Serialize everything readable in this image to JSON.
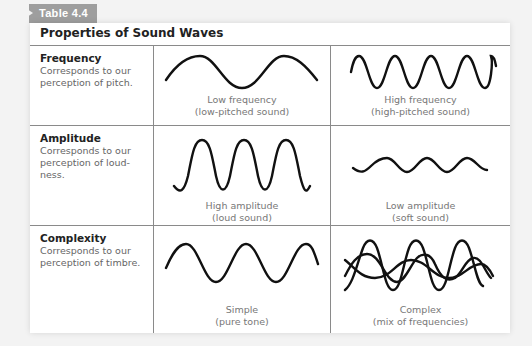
{
  "table_label": "Table 4.4",
  "title": "Properties of Sound Waves",
  "rows": [
    {
      "property": "Frequency",
      "description": "Corresponds to our perception of pitch.",
      "left": {
        "caption1": "Low frequency",
        "caption2": "(low-pitched sound)",
        "wave": "low-frequency-wave"
      },
      "right": {
        "caption1": "High frequency",
        "caption2": "(high-pitched sound)",
        "wave": "high-frequency-wave"
      }
    },
    {
      "property": "Amplitude",
      "description": "Corresponds to our perception of loud-ness.",
      "left": {
        "caption1": "High amplitude",
        "caption2": "(loud sound)",
        "wave": "high-amplitude-wave"
      },
      "right": {
        "caption1": "Low amplitude",
        "caption2": "(soft sound)",
        "wave": "low-amplitude-wave"
      }
    },
    {
      "property": "Complexity",
      "description": "Corresponds to our perception of timbre.",
      "left": {
        "caption1": "Simple",
        "caption2": "(pure tone)",
        "wave": "simple-wave"
      },
      "right": {
        "caption1": "Complex",
        "caption2": "(mix of frequencies)",
        "wave": "complex-wave"
      }
    }
  ],
  "colors": {
    "tab_bg": "#9e9e9e",
    "rule": "#8a8a8a",
    "wave": "#111111",
    "caption": "#777777"
  }
}
